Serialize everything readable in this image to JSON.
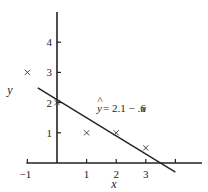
{
  "chart_data": {
    "type": "scatter",
    "title": "",
    "xlabel": "x",
    "ylabel": "y",
    "xlim": [
      -1,
      4.9
    ],
    "ylim": [
      -0.4,
      5
    ],
    "x_ticks": [
      -1,
      1,
      2,
      3,
      4
    ],
    "x_tick_labels": [
      "−1",
      "1",
      "2",
      "3",
      ""
    ],
    "y_ticks": [
      1,
      2,
      3,
      4
    ],
    "y_tick_labels": [
      "1",
      "2",
      "3",
      "4"
    ],
    "grid": false,
    "points": [
      {
        "x": -1,
        "y": 3
      },
      {
        "x": 0,
        "y": 2
      },
      {
        "x": 1,
        "y": 1
      },
      {
        "x": 2,
        "y": 1
      },
      {
        "x": 3,
        "y": 0.5
      }
    ],
    "regression_line": {
      "intercept": 2.1,
      "slope": -0.6,
      "x_range": [
        -0.65,
        4.0
      ],
      "label_yhat": "y",
      "label_rest": " = 2.1 − .6",
      "label_var": "x"
    },
    "marker": "x"
  }
}
